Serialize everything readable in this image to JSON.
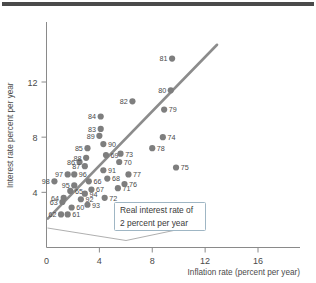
{
  "figure": {
    "top_rule": "decorative-rule"
  },
  "chart_data": {
    "type": "scatter",
    "title": "",
    "xlabel": "Inflation rate (percent per year)",
    "ylabel": "Interest rate percent per year",
    "xlim": [
      0,
      19
    ],
    "ylim": [
      0,
      15.5
    ],
    "xticks": [
      "0",
      "4",
      "8",
      "12",
      "16"
    ],
    "xtick_values": [
      0,
      4,
      8,
      12,
      16
    ],
    "yticks": [
      "4",
      "8",
      "12"
    ],
    "ytick_values": [
      4,
      8,
      12
    ],
    "grid": false,
    "legend": "none",
    "point_color": "#7e7e7e",
    "line_color": "#8c8c8c",
    "annotations": [
      {
        "name": "real-interest-rate-callout",
        "line1": "Real interest rate of",
        "line2": "2 percent per year"
      }
    ],
    "fit_line": {
      "name": "real-interest-rate-2-percent-line",
      "x_start": 0.1,
      "y_start": 2.1,
      "x_end": 12.9,
      "y_end": 14.7
    },
    "labels": [
      "60",
      "61",
      "62",
      "63",
      "64",
      "65",
      "66",
      "67",
      "68",
      "69",
      "70",
      "71",
      "72",
      "73",
      "74",
      "75",
      "76",
      "77",
      "78",
      "79",
      "80",
      "81",
      "82",
      "83",
      "84",
      "85",
      "86",
      "87",
      "88",
      "89",
      "90",
      "91",
      "92",
      "93",
      "94",
      "95",
      "96",
      "97",
      "98"
    ],
    "points": [
      {
        "label": "98",
        "x": 0.6,
        "y": 4.8
      },
      {
        "label": "97",
        "x": 1.6,
        "y": 5.3
      },
      {
        "label": "96",
        "x": 2.1,
        "y": 5.3
      },
      {
        "label": "95",
        "x": 2.1,
        "y": 4.5
      },
      {
        "label": "64",
        "x": 1.3,
        "y": 3.6
      },
      {
        "label": "63",
        "x": 1.2,
        "y": 3.3
      },
      {
        "label": "62",
        "x": 1.1,
        "y": 2.4
      },
      {
        "label": "61",
        "x": 1.6,
        "y": 2.4
      },
      {
        "label": "60",
        "x": 1.9,
        "y": 2.9
      },
      {
        "label": "65",
        "x": 1.8,
        "y": 4.1
      },
      {
        "label": "92",
        "x": 2.6,
        "y": 3.5
      },
      {
        "label": "93",
        "x": 3.1,
        "y": 3.1
      },
      {
        "label": "94",
        "x": 2.9,
        "y": 3.9
      },
      {
        "label": "86",
        "x": 2.5,
        "y": 6.2
      },
      {
        "label": "85",
        "x": 3.1,
        "y": 7.2
      },
      {
        "label": "88",
        "x": 3.0,
        "y": 6.5
      },
      {
        "label": "87",
        "x": 2.9,
        "y": 5.9
      },
      {
        "label": "66",
        "x": 3.2,
        "y": 4.8
      },
      {
        "label": "67",
        "x": 3.4,
        "y": 4.2
      },
      {
        "label": "89",
        "x": 4.0,
        "y": 8.1
      },
      {
        "label": "83",
        "x": 4.1,
        "y": 8.6
      },
      {
        "label": "84",
        "x": 4.1,
        "y": 9.5
      },
      {
        "label": "90",
        "x": 4.3,
        "y": 7.5
      },
      {
        "label": "69",
        "x": 4.5,
        "y": 6.7
      },
      {
        "label": "91",
        "x": 4.3,
        "y": 5.6
      },
      {
        "label": "68",
        "x": 4.6,
        "y": 5.0
      },
      {
        "label": "72",
        "x": 4.4,
        "y": 3.6
      },
      {
        "label": "71",
        "x": 5.4,
        "y": 4.3
      },
      {
        "label": "76",
        "x": 5.9,
        "y": 4.6
      },
      {
        "label": "73",
        "x": 5.6,
        "y": 6.8
      },
      {
        "label": "70",
        "x": 5.5,
        "y": 6.2
      },
      {
        "label": "77",
        "x": 6.2,
        "y": 5.3
      },
      {
        "label": "82",
        "x": 6.5,
        "y": 10.6
      },
      {
        "label": "78",
        "x": 8.0,
        "y": 7.2
      },
      {
        "label": "74",
        "x": 8.8,
        "y": 8.0
      },
      {
        "label": "79",
        "x": 8.9,
        "y": 10.0
      },
      {
        "label": "80",
        "x": 9.4,
        "y": 11.4
      },
      {
        "label": "81",
        "x": 9.5,
        "y": 13.7
      },
      {
        "label": "75",
        "x": 9.8,
        "y": 5.8
      }
    ]
  }
}
